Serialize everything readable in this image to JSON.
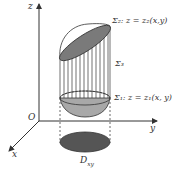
{
  "diagram": {
    "axes": {
      "z": "z",
      "y": "y",
      "x": "x",
      "origin": "O"
    },
    "labels": {
      "sigma2": "Σ₂: z = z₂(x,y)",
      "sigma3": "Σ₃",
      "sigma1": "Σ₁: z = z₁(x, y)",
      "region": "D",
      "region_sub": "xy"
    },
    "colors": {
      "line": "#333333",
      "top_fill": "#7a7a7a",
      "bottom_fill": "#a8a8a8",
      "region_fill": "#555555"
    }
  }
}
